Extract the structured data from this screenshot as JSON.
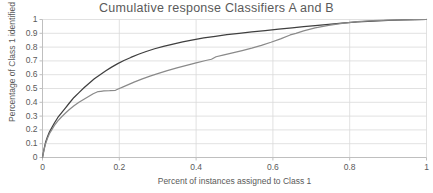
{
  "chart_data": {
    "type": "line",
    "title": "Cumulative response Classifiers A and B",
    "xlabel": "Percent of instances assigned to Class 1",
    "ylabel": "Percentage of Class 1 identified",
    "xlim": [
      0,
      1
    ],
    "ylim": [
      0,
      1
    ],
    "grid": true,
    "legend": "none",
    "x_ticks": [
      "0",
      "0.2",
      "0.4",
      "0.6",
      "0.8",
      "1"
    ],
    "x_tick_values": [
      0,
      0.2,
      0.4,
      0.6,
      0.8,
      1
    ],
    "y_ticks": [
      "0",
      "0.1",
      "0.2",
      "0.3",
      "0.4",
      "0.5",
      "0.6",
      "0.7",
      "0.8",
      "0.9",
      "1"
    ],
    "y_tick_values": [
      0,
      0.1,
      0.2,
      0.3,
      0.4,
      0.5,
      0.6,
      0.7,
      0.8,
      0.9,
      1
    ],
    "colors": {
      "series_a": "#3f3f3f",
      "series_b": "#8a8a8a",
      "grid": "#d9d9d9",
      "axis": "#bfbfbf",
      "text": "#5a5a5a",
      "background": "#ffffff"
    },
    "series": [
      {
        "name": "Classifier A",
        "color": "#3f3f3f",
        "x": [
          0.0,
          0.004,
          0.008,
          0.013,
          0.018,
          0.024,
          0.031,
          0.04,
          0.05,
          0.06,
          0.07,
          0.082,
          0.095,
          0.108,
          0.12,
          0.135,
          0.15,
          0.165,
          0.18,
          0.196,
          0.212,
          0.23,
          0.25,
          0.27,
          0.292,
          0.315,
          0.34,
          0.365,
          0.392,
          0.42,
          0.45,
          0.48,
          0.512,
          0.545,
          0.58,
          0.615,
          0.65,
          0.68,
          0.71,
          0.745,
          0.78,
          0.82,
          0.86,
          0.9,
          0.94,
          0.97,
          1.0
        ],
        "y": [
          0.0,
          0.06,
          0.11,
          0.15,
          0.185,
          0.215,
          0.25,
          0.29,
          0.325,
          0.36,
          0.395,
          0.435,
          0.47,
          0.505,
          0.535,
          0.57,
          0.6,
          0.628,
          0.655,
          0.68,
          0.703,
          0.725,
          0.748,
          0.768,
          0.788,
          0.805,
          0.822,
          0.838,
          0.852,
          0.866,
          0.878,
          0.89,
          0.9,
          0.91,
          0.92,
          0.93,
          0.94,
          0.948,
          0.956,
          0.965,
          0.973,
          0.982,
          0.989,
          0.994,
          0.998,
          0.999,
          1.0
        ]
      },
      {
        "name": "Classifier B",
        "color": "#8a8a8a",
        "x": [
          0.0,
          0.004,
          0.008,
          0.013,
          0.018,
          0.024,
          0.031,
          0.04,
          0.05,
          0.06,
          0.07,
          0.082,
          0.095,
          0.108,
          0.12,
          0.132,
          0.145,
          0.152,
          0.16,
          0.175,
          0.19,
          0.2,
          0.21,
          0.225,
          0.24,
          0.26,
          0.28,
          0.3,
          0.325,
          0.35,
          0.375,
          0.4,
          0.425,
          0.44,
          0.452,
          0.47,
          0.495,
          0.52,
          0.545,
          0.57,
          0.595,
          0.62,
          0.645,
          0.66,
          0.68,
          0.71,
          0.745,
          0.78,
          0.82,
          0.86,
          0.9,
          0.94,
          0.97,
          1.0
        ],
        "y": [
          0.0,
          0.055,
          0.1,
          0.14,
          0.172,
          0.2,
          0.232,
          0.265,
          0.295,
          0.322,
          0.348,
          0.375,
          0.4,
          0.422,
          0.442,
          0.462,
          0.478,
          0.48,
          0.482,
          0.484,
          0.487,
          0.5,
          0.512,
          0.53,
          0.548,
          0.57,
          0.59,
          0.608,
          0.63,
          0.65,
          0.668,
          0.686,
          0.703,
          0.712,
          0.73,
          0.742,
          0.758,
          0.775,
          0.792,
          0.812,
          0.835,
          0.86,
          0.888,
          0.9,
          0.918,
          0.94,
          0.958,
          0.972,
          0.984,
          0.991,
          0.995,
          0.998,
          0.999,
          1.0
        ]
      }
    ]
  }
}
